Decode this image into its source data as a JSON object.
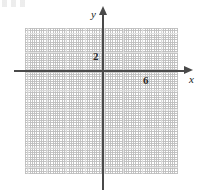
{
  "figure": {
    "kind": "coordinate-grid",
    "background_color": "#ffffff",
    "axis_color": "#4a4a4a",
    "grid_color": "#c9c9c9",
    "grid_major_color": "#e2e2e2",
    "label_color": "#2b2b2b"
  },
  "axes": {
    "x_name": "x",
    "y_name": "y",
    "x_arrow": "right-arrow-icon",
    "y_arrow": "up-arrow-icon"
  },
  "ticks": {
    "x": [
      {
        "value": 6,
        "label": "6"
      }
    ],
    "y": [
      {
        "value": 2,
        "label": "2"
      }
    ]
  },
  "chart_data": {
    "type": "scatter",
    "title": "",
    "subtitle": "",
    "xlabel": "x",
    "ylabel": "y",
    "series": [
      {
        "name": "",
        "x": [],
        "y": []
      }
    ],
    "x": [],
    "values": [],
    "categories": [],
    "xlim": [
      -8,
      8
    ],
    "ylim": [
      -11,
      4.5
    ],
    "xticks": [
      6
    ],
    "xticklabels": [
      "6"
    ],
    "yticks": [
      2
    ],
    "yticklabels": [
      "2"
    ],
    "grid": true,
    "grid_style": "dotted",
    "grid_minor_spacing": 1,
    "grid_major_spacing": 2,
    "legend": null,
    "legend_position": "none",
    "annotations": [],
    "note": "Empty blank coordinate plane with dotted grid; only the tick labels 2 (on the y-axis) and 6 (on the x-axis) are shown. No data is plotted."
  }
}
